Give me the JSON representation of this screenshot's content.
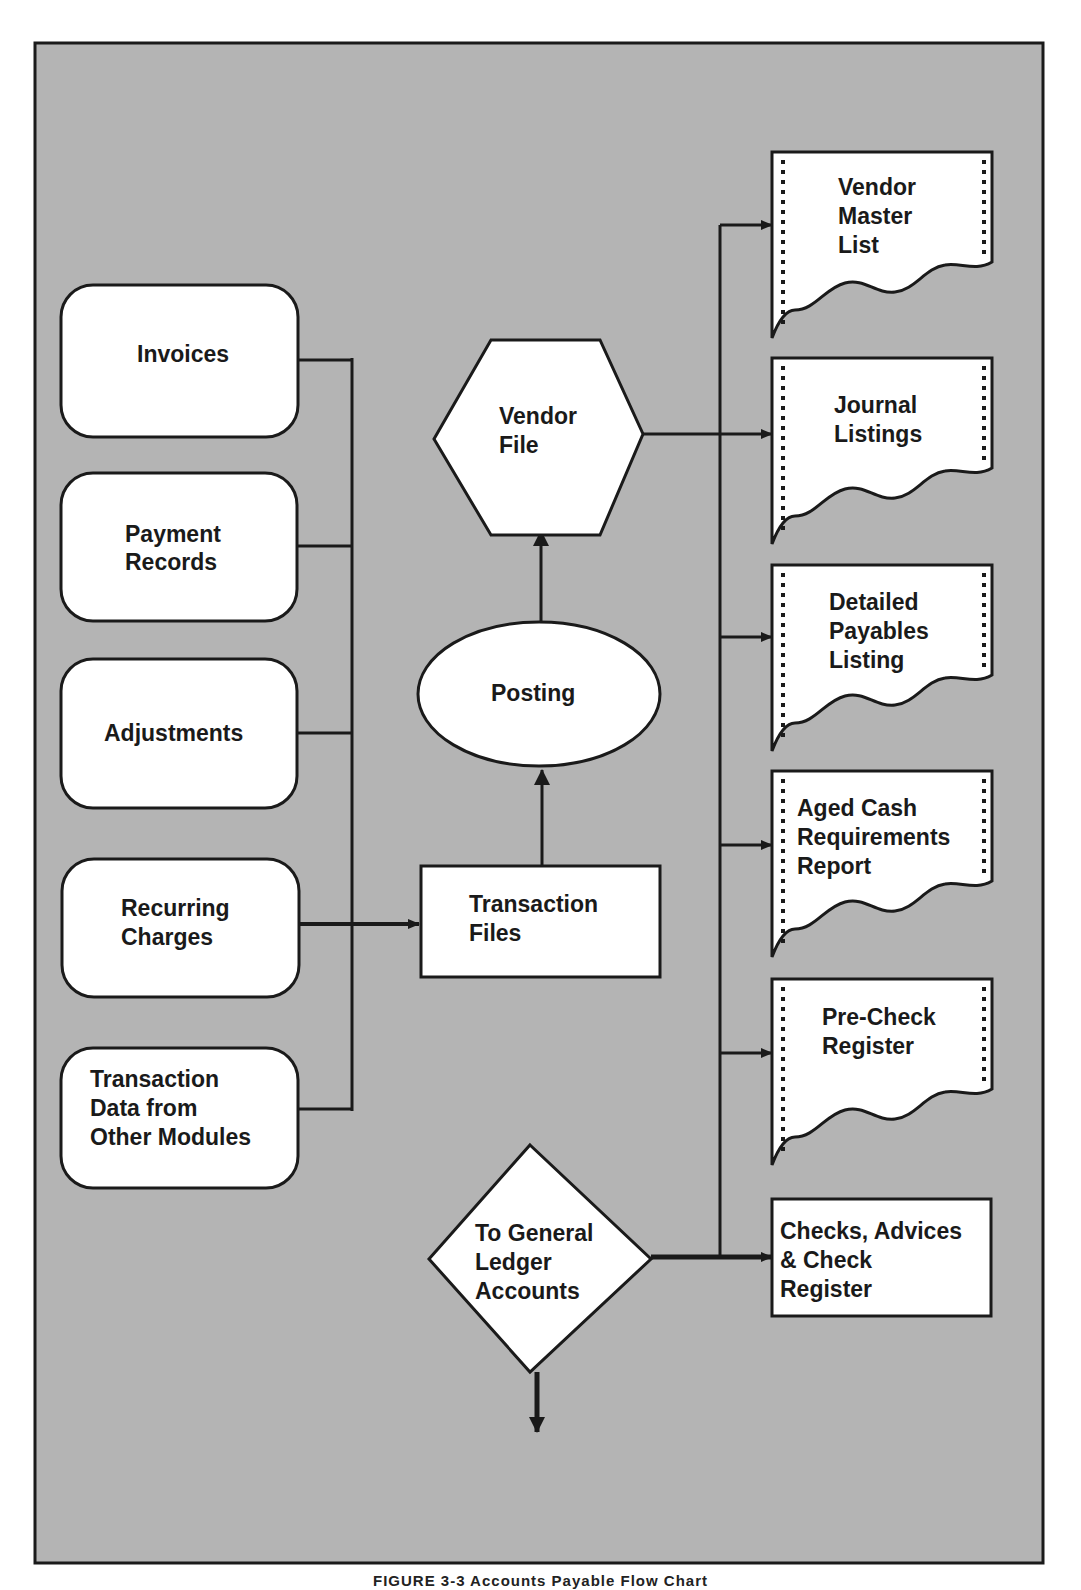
{
  "colors": {
    "background": "#b4b4b4",
    "shape_fill": "#ffffff",
    "stroke": "#1a1a1a",
    "page": "#ffffff"
  },
  "diagram": {
    "inputs": [
      {
        "id": "invoices",
        "lines": [
          "Invoices"
        ]
      },
      {
        "id": "payment-records",
        "lines": [
          "Payment",
          "Records"
        ]
      },
      {
        "id": "adjustments",
        "lines": [
          "Adjustments"
        ]
      },
      {
        "id": "recurring-charges",
        "lines": [
          "Recurring",
          "Charges"
        ]
      },
      {
        "id": "transaction-data",
        "lines": [
          "Transaction",
          "Data from",
          "Other Modules"
        ]
      }
    ],
    "transaction_files": {
      "lines": [
        "Transaction",
        "Files"
      ],
      "shape": "rectangle"
    },
    "posting": {
      "lines": [
        "Posting"
      ],
      "shape": "ellipse"
    },
    "vendor_file": {
      "lines": [
        "Vendor",
        "File"
      ],
      "shape": "hexagon"
    },
    "general_ledger": {
      "lines": [
        "To General",
        "Ledger",
        "Accounts"
      ],
      "shape": "diamond"
    },
    "outputs": [
      {
        "id": "vendor-master-list",
        "lines": [
          "Vendor",
          "Master",
          "List"
        ],
        "shape": "document"
      },
      {
        "id": "journal-listings",
        "lines": [
          "Journal",
          "Listings"
        ],
        "shape": "document"
      },
      {
        "id": "detailed-payables-listing",
        "lines": [
          "Detailed",
          "Payables",
          "Listing"
        ],
        "shape": "document"
      },
      {
        "id": "aged-cash-requirements-report",
        "lines": [
          "Aged Cash",
          "Requirements",
          "Report"
        ],
        "shape": "document"
      },
      {
        "id": "pre-check-register",
        "lines": [
          "Pre-Check",
          "Register"
        ],
        "shape": "document"
      },
      {
        "id": "checks-advices-check-register",
        "lines": [
          "Checks, Advices",
          "& Check",
          "Register"
        ],
        "shape": "rectangle"
      }
    ]
  },
  "caption": "FIGURE 3-3 Accounts Payable Flow Chart"
}
